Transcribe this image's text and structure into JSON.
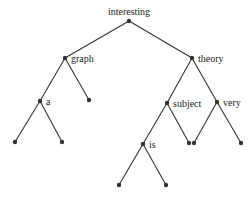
{
  "diagram": {
    "type": "binary-tree",
    "colors": {
      "edge": "#333333",
      "node": "#333333",
      "text": "#222222"
    },
    "nodes": [
      {
        "id": "interesting",
        "label": "interesting",
        "x": 129,
        "y": 21,
        "label_pos": "top"
      },
      {
        "id": "graph",
        "label": "graph",
        "x": 65,
        "y": 58,
        "label_pos": "right"
      },
      {
        "id": "theory",
        "label": "theory",
        "x": 192,
        "y": 58,
        "label_pos": "right"
      },
      {
        "id": "a",
        "label": "a",
        "x": 40,
        "y": 101,
        "label_pos": "right"
      },
      {
        "id": "graph-right-leaf",
        "label": "",
        "x": 89,
        "y": 100
      },
      {
        "id": "subject",
        "label": "subject",
        "x": 167,
        "y": 103,
        "label_pos": "right"
      },
      {
        "id": "very",
        "label": "very",
        "x": 217,
        "y": 102,
        "label_pos": "right"
      },
      {
        "id": "a-left-leaf",
        "label": "",
        "x": 15,
        "y": 142
      },
      {
        "id": "a-right-leaf",
        "label": "",
        "x": 62,
        "y": 142
      },
      {
        "id": "is",
        "label": "is",
        "x": 143,
        "y": 144,
        "label_pos": "right"
      },
      {
        "id": "subject-right-leaf",
        "label": "",
        "x": 189,
        "y": 143
      },
      {
        "id": "very-left-leaf",
        "label": "",
        "x": 194,
        "y": 143
      },
      {
        "id": "very-right-leaf",
        "label": "",
        "x": 241,
        "y": 143
      },
      {
        "id": "is-left-leaf",
        "label": "",
        "x": 119,
        "y": 185
      },
      {
        "id": "is-right-leaf",
        "label": "",
        "x": 166,
        "y": 185
      }
    ],
    "edges": [
      [
        "interesting",
        "graph"
      ],
      [
        "interesting",
        "theory"
      ],
      [
        "graph",
        "a"
      ],
      [
        "graph",
        "graph-right-leaf"
      ],
      [
        "theory",
        "subject"
      ],
      [
        "theory",
        "very"
      ],
      [
        "a",
        "a-left-leaf"
      ],
      [
        "a",
        "a-right-leaf"
      ],
      [
        "subject",
        "is"
      ],
      [
        "subject",
        "subject-right-leaf"
      ],
      [
        "very",
        "very-left-leaf"
      ],
      [
        "very",
        "very-right-leaf"
      ],
      [
        "is",
        "is-left-leaf"
      ],
      [
        "is",
        "is-right-leaf"
      ]
    ]
  }
}
